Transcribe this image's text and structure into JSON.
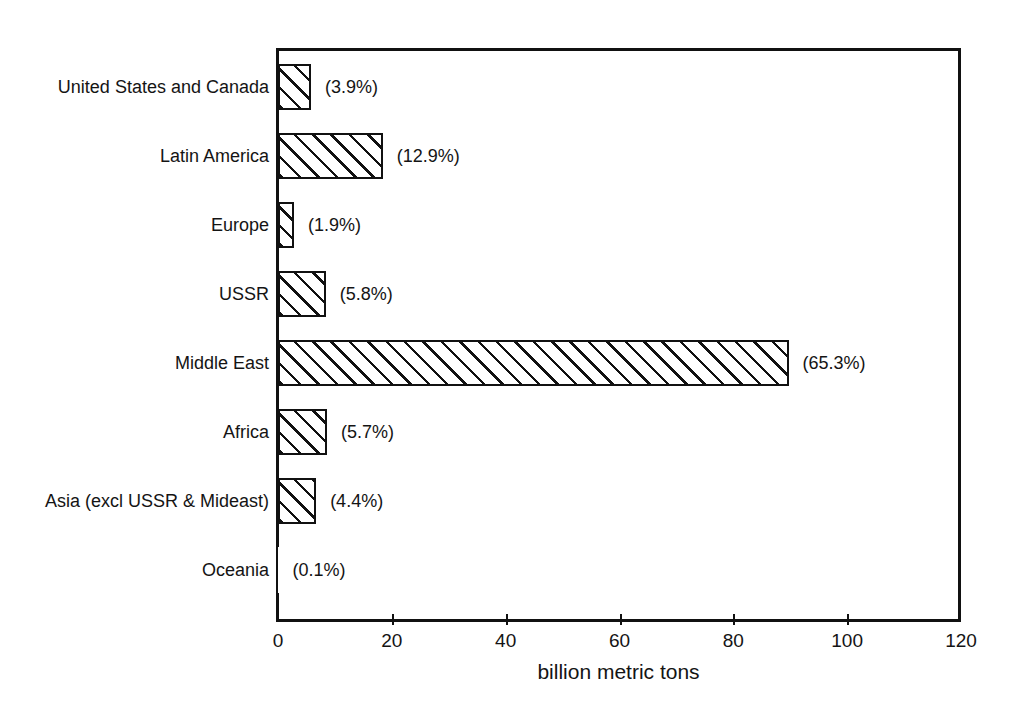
{
  "chart_data": {
    "type": "bar",
    "orientation": "horizontal",
    "title": "",
    "subtitle": "",
    "xlabel": "billion metric tons",
    "ylabel": "",
    "xlim": [
      0,
      120
    ],
    "xticks": [
      0,
      20,
      40,
      60,
      80,
      100,
      120
    ],
    "xtick_labels": [
      "0",
      "20",
      "40",
      "60",
      "80",
      "100",
      "120"
    ],
    "grid": false,
    "legend": false,
    "bar_style": "diagonal-hatch-45",
    "bar_fill_color": "#ffffff",
    "bar_edge_color": "#111111",
    "categories": [
      "United States and Canada",
      "Latin America",
      "Europe",
      "USSR",
      "Middle East",
      "Africa",
      "Asia (excl USSR & Mideast)",
      "Oceania"
    ],
    "values": [
      5.8,
      18.4,
      2.8,
      8.4,
      89.7,
      8.6,
      6.7,
      0.1
    ],
    "point_labels": [
      "(3.9%)",
      "(12.9%)",
      "(1.9%)",
      "(5.8%)",
      "(65.3%)",
      "(5.7%)",
      "(4.4%)",
      "(0.1%)"
    ],
    "percentages": [
      3.9,
      12.9,
      1.9,
      5.8,
      65.3,
      5.7,
      4.4,
      0.1
    ]
  }
}
